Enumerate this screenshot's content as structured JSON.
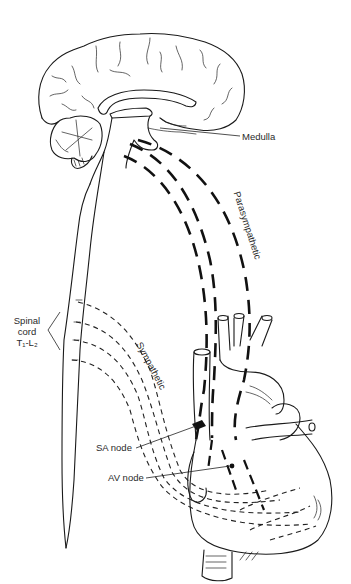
{
  "diagram": {
    "labels": {
      "medulla": "Medulla",
      "parasympathetic": "Parasympathetic",
      "spinal_cord_line1": "Spinal",
      "spinal_cord_line2": "cord",
      "spinal_cord_line3": "T₁-L₂",
      "sympathetic": "Sympathetic",
      "sa_node": "SA node",
      "av_node": "AV node"
    },
    "structures": [
      "brain (sagittal)",
      "cerebellum",
      "brainstem/medulla",
      "spinal cord",
      "heart",
      "aorta",
      "vena cava",
      "pulmonary vessels"
    ],
    "pathways": [
      {
        "name": "parasympathetic",
        "style": "heavy dashed",
        "from": "medulla",
        "to": "SA node / AV node"
      },
      {
        "name": "sympathetic",
        "style": "light dashed",
        "from": "spinal cord T1-L2",
        "to": "heart ventricles"
      }
    ],
    "colors": {
      "line": "#1a1a1a",
      "background": "#ffffff"
    }
  }
}
